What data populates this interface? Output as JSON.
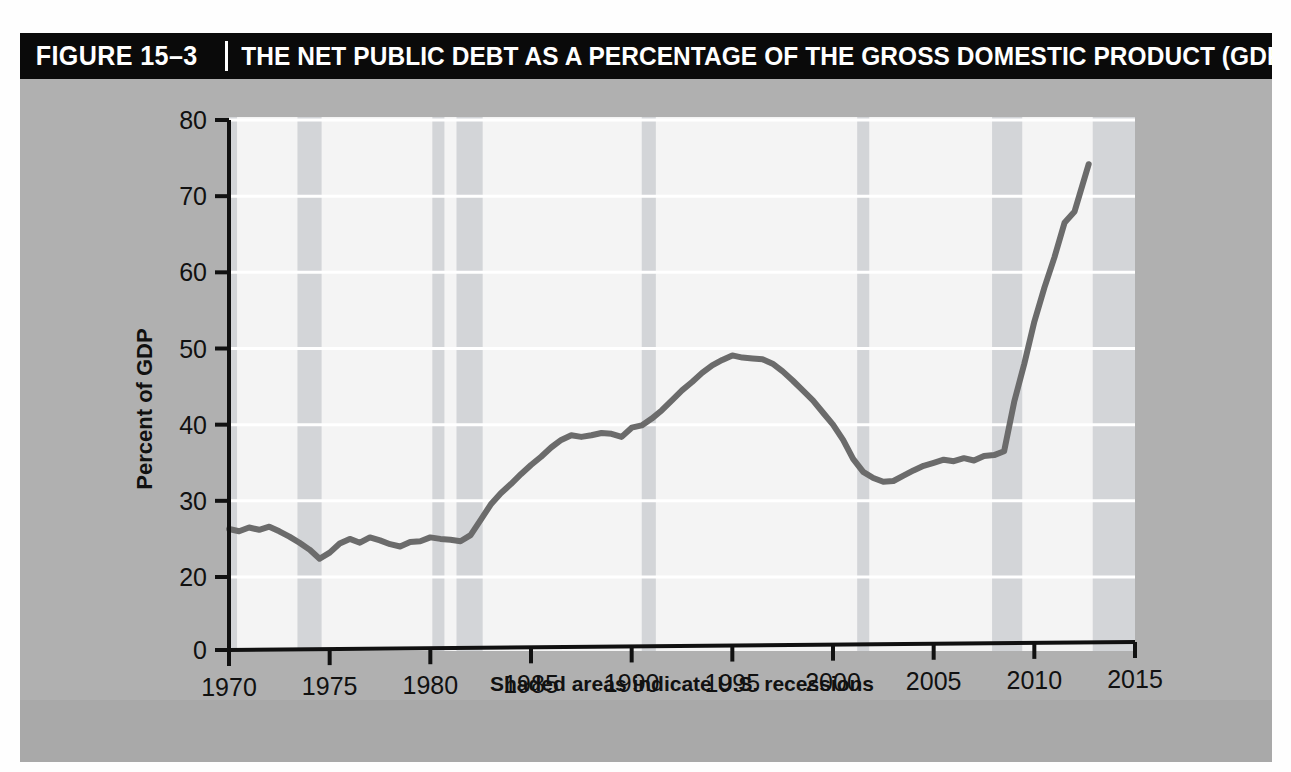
{
  "figure": {
    "number": "FIGURE 15–3",
    "title": "THE NET PUBLIC DEBT AS A PERCENTAGE OF THE GROSS DOMESTIC PRODUCT (GDP)"
  },
  "colors": {
    "panel_background": "#b0b0b0",
    "title_bar": "#0a0a0a",
    "title_text": "#ffffff",
    "plot_background": "#f4f4f4",
    "recession_band": "#d3d5d8",
    "line": "#6b6b6b",
    "axis": "#111111",
    "gridline": "#ffffff"
  },
  "chart_data": {
    "type": "line",
    "title": "THE NET PUBLIC DEBT AS A PERCENTAGE OF THE GROSS DOMESTIC PRODUCT (GDP)",
    "subtitle": "Shaded areas indicate U.S. recessions",
    "xlabel": "",
    "ylabel": "Percent of GDP",
    "xlim": [
      1970,
      2015
    ],
    "ylim": [
      0,
      80
    ],
    "y_axis_break": true,
    "y_axis_break_note": "axis is broken between 0 and 20; no 10 tick is drawn",
    "grid": "horizontal",
    "legend": "none",
    "xticks": [
      1970,
      1975,
      1980,
      1985,
      1990,
      1995,
      2000,
      2005,
      2010,
      2015
    ],
    "xtick_labels": [
      "1970",
      "1975",
      "1980",
      "1985",
      "1990",
      "1995",
      "2000",
      "2005",
      "2010",
      "2015"
    ],
    "yticks": [
      0,
      20,
      30,
      40,
      50,
      60,
      70,
      80
    ],
    "ytick_labels": [
      "0",
      "20",
      "30",
      "40",
      "50",
      "60",
      "70",
      "80"
    ],
    "series": [
      {
        "name": "Net public debt as a percentage of GDP",
        "x": [
          1970.0,
          1970.5,
          1971.0,
          1971.5,
          1972.0,
          1972.5,
          1973.0,
          1973.5,
          1974.0,
          1974.5,
          1975.0,
          1975.5,
          1976.0,
          1976.5,
          1977.0,
          1977.5,
          1978.0,
          1978.5,
          1979.0,
          1979.5,
          1980.0,
          1980.5,
          1981.0,
          1981.5,
          1982.0,
          1982.5,
          1983.0,
          1983.5,
          1984.0,
          1984.5,
          1985.0,
          1985.5,
          1986.0,
          1986.5,
          1987.0,
          1987.5,
          1988.0,
          1988.5,
          1989.0,
          1989.5,
          1990.0,
          1990.5,
          1991.0,
          1991.5,
          1992.0,
          1992.5,
          1993.0,
          1993.5,
          1994.0,
          1994.5,
          1995.0,
          1995.5,
          1996.0,
          1996.5,
          1997.0,
          1997.5,
          1998.0,
          1998.5,
          1999.0,
          1999.5,
          2000.0,
          2000.5,
          2001.0,
          2001.5,
          2002.0,
          2002.5,
          2003.0,
          2003.5,
          2004.0,
          2004.5,
          2005.0,
          2005.5,
          2006.0,
          2006.5,
          2007.0,
          2007.5,
          2008.0,
          2008.5,
          2009.0,
          2009.5,
          2010.0,
          2010.5,
          2011.0,
          2011.5,
          2012.0,
          2012.7
        ],
        "values": [
          26.3,
          26.0,
          26.5,
          26.2,
          26.6,
          26.0,
          25.3,
          24.5,
          23.6,
          22.4,
          23.2,
          24.4,
          25.0,
          24.5,
          25.2,
          24.8,
          24.3,
          24.0,
          24.6,
          24.7,
          25.2,
          25.0,
          24.9,
          24.7,
          25.5,
          27.5,
          29.5,
          31.0,
          32.2,
          33.5,
          34.7,
          35.8,
          37.0,
          38.0,
          38.6,
          38.4,
          38.6,
          38.9,
          38.8,
          38.4,
          39.6,
          39.9,
          40.8,
          41.9,
          43.2,
          44.5,
          45.6,
          46.8,
          47.8,
          48.5,
          49.1,
          48.8,
          48.7,
          48.6,
          48.0,
          47.0,
          45.8,
          44.5,
          43.2,
          41.6,
          40.0,
          38.0,
          35.5,
          33.8,
          33.0,
          32.5,
          32.6,
          33.3,
          34.0,
          34.6,
          35.0,
          35.4,
          35.2,
          35.6,
          35.3,
          35.9,
          36.0,
          36.5,
          43.0,
          48.0,
          53.5,
          58.0,
          62.0,
          66.5,
          68.0,
          74.2
        ]
      }
    ],
    "recessions": [
      {
        "label": "1969-70 recession",
        "start": 1969.9,
        "end": 1970.4
      },
      {
        "label": "1973-75 recession",
        "start": 1973.4,
        "end": 1974.6
      },
      {
        "label": "1980 recession",
        "start": 1980.1,
        "end": 1980.7
      },
      {
        "label": "1981-82 recession",
        "start": 1981.3,
        "end": 1982.6
      },
      {
        "label": "1990-91 recession",
        "start": 1990.5,
        "end": 1991.2
      },
      {
        "label": "2001 recession",
        "start": 2001.2,
        "end": 2001.8
      },
      {
        "label": "2007-09 recession",
        "start": 2007.9,
        "end": 2009.4
      },
      {
        "label": "post-2012 shading",
        "start": 2012.9,
        "end": 2015.0
      }
    ]
  }
}
